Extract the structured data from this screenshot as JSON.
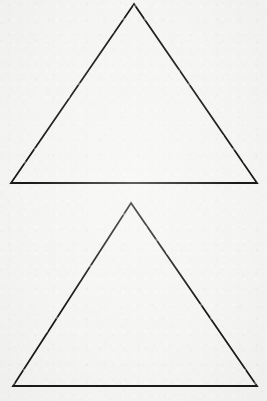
{
  "figure": {
    "canvas": {
      "width": 267,
      "height": 401,
      "background_color": "#f5f5f3",
      "has_border": false,
      "has_text_labels": false,
      "texture": "paper-grain"
    },
    "stroke": {
      "color": "#1a1a1a",
      "width": 1.8,
      "fill": "none",
      "linejoin": "miter",
      "linecap": "butt"
    },
    "shape_count": 2,
    "shapes": [
      {
        "id": "triangle-top",
        "name": "upper-triangle",
        "type": "triangle",
        "orientation": "apex-up",
        "points": "134,4 257,183 11,183",
        "apex": {
          "x": 134,
          "y": 4
        },
        "base_left": {
          "x": 11,
          "y": 183
        },
        "base_right": {
          "x": 257,
          "y": 183
        },
        "base_width": 246,
        "height": 179,
        "fill": "none"
      },
      {
        "id": "triangle-bottom",
        "name": "lower-triangle",
        "type": "triangle",
        "orientation": "apex-up",
        "points": "131,203 257,386 13,386",
        "apex": {
          "x": 131,
          "y": 203
        },
        "base_left": {
          "x": 13,
          "y": 386
        },
        "base_right": {
          "x": 257,
          "y": 386
        },
        "base_width": 244,
        "height": 183,
        "fill": "none"
      }
    ],
    "gap_between_shapes": 20
  }
}
